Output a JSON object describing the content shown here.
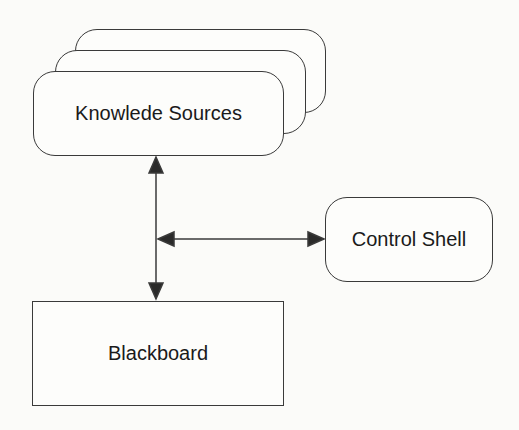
{
  "diagram": {
    "nodes": {
      "knowledge_sources": {
        "label": "Knowlede Sources",
        "shape": "stacked-rounded-rect",
        "stack_count": 3
      },
      "control_shell": {
        "label": "Control Shell",
        "shape": "rounded-rect"
      },
      "blackboard": {
        "label": "Blackboard",
        "shape": "rect"
      }
    },
    "edges": [
      {
        "from": "knowledge_sources",
        "to": "blackboard",
        "direction": "bidirectional"
      },
      {
        "from": "vertical-connector",
        "to": "control_shell",
        "direction": "bidirectional"
      }
    ],
    "colors": {
      "stroke": "#3a3a3a",
      "background": "#fbfbf9",
      "text": "#1a1a1a"
    }
  }
}
